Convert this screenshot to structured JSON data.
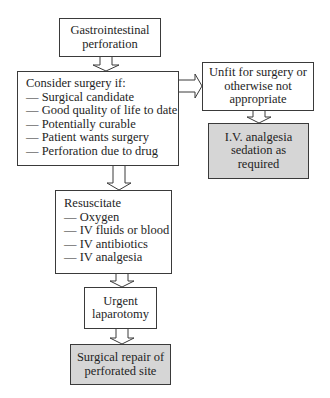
{
  "diagram": {
    "type": "flowchart",
    "nodes": {
      "start": {
        "lines": [
          "Gastrointestinal",
          "perforation"
        ]
      },
      "consider": {
        "heading": "Consider surgery if:",
        "items": [
          "— Surgical candidate",
          "— Good quality of life to date",
          "— Potentially curable",
          "— Patient wants surgery",
          "— Perforation due to drug"
        ]
      },
      "unfit": {
        "lines": [
          "Unfit for surgery or",
          "otherwise not",
          "appropriate"
        ]
      },
      "palliative": {
        "lines": [
          "I.V. analgesia",
          "sedation as",
          "required"
        ],
        "fill": "#d6d6d6"
      },
      "resuscitate": {
        "heading": "Resuscitate",
        "items": [
          "— Oxygen",
          "— IV fluids or blood",
          "— IV antibiotics",
          "— IV analgesia"
        ]
      },
      "laparotomy": {
        "lines": [
          "Urgent",
          "laparotomy"
        ]
      },
      "repair": {
        "lines": [
          "Surgical repair of",
          "perforated site"
        ],
        "fill": "#d6d6d6"
      }
    },
    "edges": [
      [
        "start",
        "consider"
      ],
      [
        "consider",
        "unfit"
      ],
      [
        "unfit",
        "palliative"
      ],
      [
        "consider",
        "resuscitate"
      ],
      [
        "resuscitate",
        "laparotomy"
      ],
      [
        "laparotomy",
        "repair"
      ]
    ]
  }
}
